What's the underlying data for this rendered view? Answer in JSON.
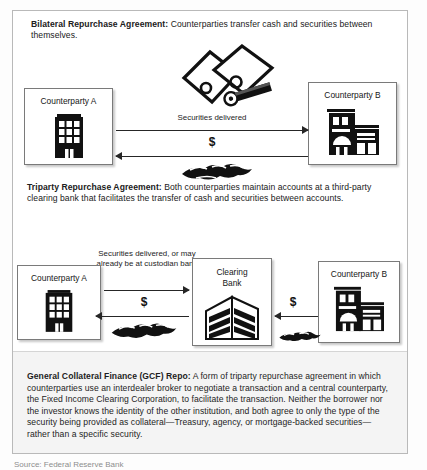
{
  "figure": {
    "bilateral": {
      "heading_bold": "Bilateral Repurchase Agreement:",
      "heading_rest": " Counterparties transfer cash and securities between themselves.",
      "entities": {
        "cpA": {
          "label": "Counterparty A",
          "icon": "office-building-icon"
        },
        "cpB": {
          "label": "Counterparty B",
          "icon": "bank-building-icon"
        }
      },
      "flows": {
        "securities_label": "Securities delivered",
        "securities_direction": "right",
        "cash_label": "$",
        "cash_direction": "left"
      },
      "art": {
        "securities": "securities-certificates-icon",
        "cash": "cash-banknotes-icon"
      }
    },
    "triparty": {
      "heading_bold": "Triparty Repurchase Agreement:",
      "heading_rest": " Both counterparties maintain accounts at a third-party clearing bank that facilitates the transfer of cash and securities between accounts.",
      "entities": {
        "cpA": {
          "label": "Counterparty A",
          "icon": "office-building-icon"
        },
        "clearing": {
          "label_line1": "Clearing",
          "label_line2": "Bank",
          "icon": "clearing-bank-building-icon"
        },
        "cpB": {
          "label": "Counterparty B",
          "icon": "bank-building-icon"
        }
      },
      "flows": {
        "securities_label": "Securities delivered, or may already be at custodian bank",
        "securities_direction": "right",
        "cash_a_label": "$",
        "cash_a_direction": "left",
        "cash_b_label": "$",
        "cash_b_direction": "left"
      },
      "art": {
        "cash_a": "cash-banknotes-icon",
        "cash_b": "cash-banknotes-icon"
      }
    },
    "gcf": {
      "heading_bold": "General Collateral Finance (GCF) Repo:",
      "body": " A form of triparty repurchase agreement in which counterparties use an interdealer broker to negotiate a transaction and a central counterparty, the Fixed Income Clearing Corporation, to facilitate the transaction. Neither the borrower nor the investor knows the identity of the other institution, and both agree to only the type of the security being provided as collateral—Treasury, agency, or mortgage-backed securities—rather than a specific security."
    },
    "caption_partial": "Source: Federal Reserve Bank"
  },
  "colors": {
    "frame_border": "#b9b9b9",
    "box_border": "#7a7a7a",
    "arrow": "#262626",
    "gcf_background": "#f4f4f4",
    "text": "#1d1d1d"
  }
}
